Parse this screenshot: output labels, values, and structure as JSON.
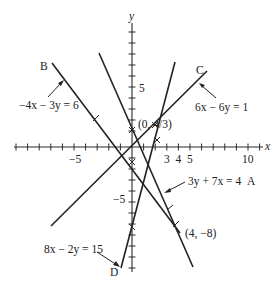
{
  "diagram": {
    "axes": {
      "x_label": "x",
      "y_label": "y",
      "x_tick_labels": [
        "−5",
        "3",
        "4",
        "5",
        "10"
      ],
      "y_tick_labels": [
        "5",
        "−5"
      ]
    },
    "lines": [
      {
        "id": "A",
        "letter": "A",
        "equation": "3y + 7x = 4"
      },
      {
        "id": "B",
        "letter": "B",
        "equation": "−4x − 3y = 6"
      },
      {
        "id": "C",
        "letter": "C",
        "equation": "6x − 6y = 1"
      },
      {
        "id": "D",
        "letter": "D",
        "equation": "8x − 2y = 15"
      }
    ],
    "points": [
      {
        "label": "(0, 4/3)"
      },
      {
        "label": "(4, −8)"
      }
    ]
  }
}
